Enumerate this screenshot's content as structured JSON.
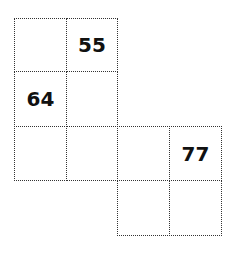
{
  "grid": {
    "cells": [
      {
        "row": 0,
        "col": 0,
        "value": ""
      },
      {
        "row": 0,
        "col": 1,
        "value": "55"
      },
      {
        "row": 1,
        "col": 0,
        "value": "64"
      },
      {
        "row": 1,
        "col": 1,
        "value": ""
      },
      {
        "row": 2,
        "col": 0,
        "value": ""
      },
      {
        "row": 2,
        "col": 1,
        "value": ""
      },
      {
        "row": 2,
        "col": 2,
        "value": ""
      },
      {
        "row": 2,
        "col": 3,
        "value": "77"
      },
      {
        "row": 3,
        "col": 2,
        "value": ""
      },
      {
        "row": 3,
        "col": 3,
        "value": ""
      }
    ]
  }
}
